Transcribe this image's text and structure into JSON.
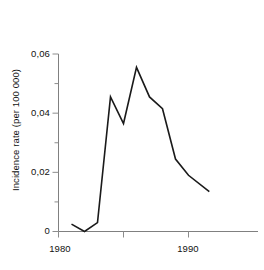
{
  "chart_data": {
    "type": "line",
    "title": "",
    "subtitle": "",
    "xlabel": "",
    "ylabel": "Incidence rate (per 100 000)",
    "xlim": [
      1980,
      1992.8
    ],
    "ylim": [
      0,
      0.06
    ],
    "grid": false,
    "legend": null,
    "x_ticks": [
      1980,
      1985,
      1990
    ],
    "x_tick_labels": [
      "1980",
      "",
      "1990"
    ],
    "x_minor_ticks": [
      1985
    ],
    "y_ticks": [
      0,
      0.01,
      0.02,
      0.03,
      0.04,
      0.05,
      0.06
    ],
    "y_tick_labels": [
      "0",
      "",
      "0,02",
      "",
      "0,04",
      "",
      "0,06"
    ],
    "decimal_separator": ",",
    "line_color": "#1a1a1a",
    "line_width": 1.6,
    "axis_color": "#808080",
    "series": [
      {
        "name": "Incidence rate",
        "x": [
          1981,
          1982,
          1983,
          1984,
          1985,
          1986,
          1987,
          1988,
          1989,
          1990,
          1991.6
        ],
        "values": [
          0.0025,
          0.0,
          0.003,
          0.0455,
          0.0365,
          0.0555,
          0.0455,
          0.0415,
          0.0245,
          0.019,
          0.0135
        ]
      }
    ]
  },
  "axes": {
    "y_title": "Incidence rate (per 100 000)",
    "y_labels": {
      "top": "0,06",
      "upper_mid": "0,04",
      "lower_mid": "0,02",
      "zero": "0"
    },
    "x_labels": {
      "start": "1980",
      "end": "1990"
    }
  }
}
